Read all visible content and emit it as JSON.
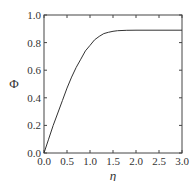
{
  "chart_data": {
    "type": "line",
    "title": "",
    "xlabel": "η",
    "ylabel": "Φ",
    "xlim": [
      0,
      3.0
    ],
    "ylim": [
      0,
      1.0
    ],
    "xticks": [
      "0.0",
      "0.5",
      "1.0",
      "1.5",
      "2.0",
      "2.5",
      "3.0"
    ],
    "yticks": [
      "0.0",
      "0.2",
      "0.4",
      "0.6",
      "0.8",
      "1.0"
    ],
    "grid": false,
    "series": [
      {
        "name": "Φ(η)",
        "x": [
          0,
          0.1,
          0.2,
          0.3,
          0.4,
          0.5,
          0.6,
          0.7,
          0.8,
          0.9,
          1.0,
          1.1,
          1.2,
          1.3,
          1.4,
          1.5,
          1.6,
          1.8,
          2.0,
          2.5,
          3.0
        ],
        "y": [
          0,
          0.1,
          0.2,
          0.29,
          0.38,
          0.47,
          0.55,
          0.62,
          0.68,
          0.74,
          0.78,
          0.82,
          0.845,
          0.865,
          0.875,
          0.882,
          0.886,
          0.889,
          0.89,
          0.89,
          0.89
        ]
      }
    ]
  }
}
